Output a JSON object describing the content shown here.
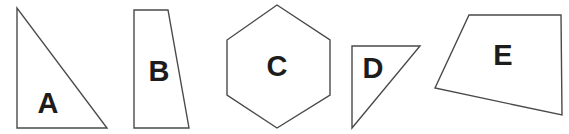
{
  "canvas": {
    "width": 569,
    "height": 134,
    "background_color": "#ffffff",
    "stroke_color": "#4a4a4a",
    "label_color": "#1c1c1c"
  },
  "shapes": [
    {
      "id": "shape-a",
      "label": "A",
      "kind": "right-triangle",
      "points": "17,8 17,128 107,128",
      "label_x": 48,
      "label_y": 105
    },
    {
      "id": "shape-b",
      "label": "B",
      "kind": "trapezoid",
      "points": "134,10 168,10 189,128 134,128",
      "label_x": 159,
      "label_y": 73
    },
    {
      "id": "shape-c",
      "label": "C",
      "kind": "hexagon",
      "points": "277,5 330,40 330,95 277,128 227,95 227,40",
      "label_x": 277,
      "label_y": 68
    },
    {
      "id": "shape-d",
      "label": "D",
      "kind": "right-triangle",
      "points": "352,46 420,46 352,128",
      "label_x": 373,
      "label_y": 70
    },
    {
      "id": "shape-e",
      "label": "E",
      "kind": "quadrilateral",
      "points": "469,15 561,15 562,115 435,88",
      "label_x": 503,
      "label_y": 57
    }
  ]
}
